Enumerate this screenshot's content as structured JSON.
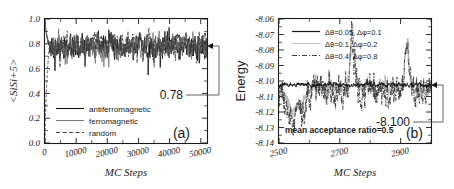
{
  "figure": {
    "caption_a": "(a)",
    "caption_b": "(b)"
  },
  "chart_data": [
    {
      "type": "line",
      "panel": "(a)",
      "title": "",
      "xlabel": "MC Steps",
      "ylabel": "<SiSi+5>",
      "xlim": [
        0,
        52000
      ],
      "ylim": [
        0.0,
        1.0
      ],
      "xticks": [
        0,
        10000,
        20000,
        30000,
        40000,
        50000
      ],
      "xticklabels": [
        "0",
        "10000",
        "20000",
        "30000",
        "40000",
        "50000"
      ],
      "yticks": [
        0.0,
        0.2,
        0.4,
        0.6,
        0.8,
        1.0
      ],
      "yticklabels": [
        "0.0",
        "0.2",
        "0.4",
        "0.6",
        "0.8",
        "1.0"
      ],
      "grid": false,
      "legend_position": "lower-center",
      "annotation": {
        "label": "0.78",
        "value": 0.78,
        "arrow": "left"
      },
      "series": [
        {
          "name": "antiferromagnetic",
          "style": "solid",
          "color": "#141414",
          "start_value": 1.0,
          "plateau_mean": 0.785,
          "plateau_noise": 0.075
        },
        {
          "name": "ferromagnetic",
          "style": "solid-thin",
          "color": "#6e6e6e",
          "start_value": 1.0,
          "plateau_mean": 0.79,
          "plateau_noise": 0.07
        },
        {
          "name": "random",
          "style": "dashed",
          "color": "#3c3c3c",
          "start_value": 0.0,
          "plateau_mean": 0.8,
          "plateau_noise": 0.065
        }
      ]
    },
    {
      "type": "line",
      "panel": "(b)",
      "title": "",
      "xlabel": "MC Steps",
      "ylabel": "Energy",
      "xlim": [
        2500,
        3000
      ],
      "ylim": [
        -8.14,
        -8.06
      ],
      "xticks": [
        2500,
        2700,
        2900
      ],
      "xticklabels": [
        "2500",
        "2700",
        "2900"
      ],
      "xminorticks": [
        2600,
        2800,
        3000
      ],
      "yticks": [
        -8.14,
        -8.13,
        -8.12,
        -8.11,
        -8.1,
        -8.09,
        -8.08,
        -8.07,
        -8.06
      ],
      "yticklabels": [
        "-8.14",
        "-8.13",
        "-8.12",
        "-8.11",
        "-8.10",
        "-8.09",
        "-8.08",
        "-8.07",
        "-8.06"
      ],
      "grid": false,
      "legend_position": "upper-center",
      "note": "mean acceptance ratio=0.5",
      "annotation": {
        "label": "-8.100",
        "value": -8.1025,
        "arrow": "left"
      },
      "series": [
        {
          "name": "Δθ=0.05, Δφ=0.1",
          "style": "solid",
          "color": "#141414",
          "plateau_mean": -8.1025,
          "plateau_noise": 0.0012
        },
        {
          "name": "Δθ=0.1, Δφ=0.2",
          "style": "solid-light",
          "color": "#b4b4b4",
          "plateau_mean": -8.1045,
          "plateau_noise": 0.004
        },
        {
          "name": "Δθ=0.4, Δφ=0.8",
          "style": "dash-dot",
          "color": "#2c2c2c",
          "plateau_mean": -8.1065,
          "plateau_noise": 0.008
        }
      ]
    }
  ]
}
